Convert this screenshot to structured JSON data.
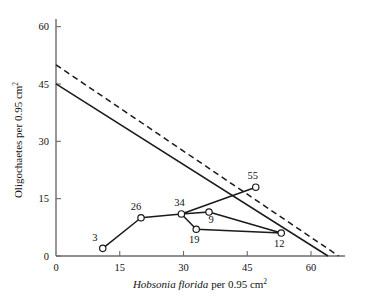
{
  "chart_data": {
    "type": "scatter",
    "title": "",
    "xlabel": "Hobsonia florida per 0.95 cm2",
    "xlabel_italic_part": "Hobsonia florida",
    "xlabel_plain_part": " per 0.95 cm",
    "xlabel_superscript": "2",
    "ylabel": "Oligochaetes per 0.95 cm2",
    "ylabel_plain_part": "Oligochaetes per 0.95 cm",
    "ylabel_superscript": "2",
    "xlim": [
      0,
      68
    ],
    "ylim": [
      0,
      62
    ],
    "xticks": [
      "0",
      "15",
      "30",
      "45",
      "60"
    ],
    "xtick_values": [
      0,
      15,
      30,
      45,
      60
    ],
    "yticks": [
      "0",
      "15",
      "30",
      "45",
      "60"
    ],
    "ytick_values": [
      0,
      15,
      30,
      45,
      60
    ],
    "grid": false,
    "legend": "none",
    "points": [
      {
        "label": "3",
        "x": 11.0,
        "y": 2.0,
        "label_dx": -8,
        "label_dy": -7
      },
      {
        "label": "26",
        "x": 20.0,
        "y": 10.0,
        "label_dx": -5,
        "label_dy": -8
      },
      {
        "label": "34",
        "x": 29.5,
        "y": 11.0,
        "label_dx": -2,
        "label_dy": -8
      },
      {
        "label": "9",
        "x": 36.0,
        "y": 11.5,
        "label_dx": 2,
        "label_dy": 11
      },
      {
        "label": "19",
        "x": 33.0,
        "y": 7.0,
        "label_dx": -2,
        "label_dy": 14
      },
      {
        "label": "12",
        "x": 53.0,
        "y": 6.0,
        "label_dx": -2,
        "label_dy": 14
      },
      {
        "label": "55",
        "x": 47.0,
        "y": 18.0,
        "label_dx": -3,
        "label_dy": -8
      }
    ],
    "trajectory_order": [
      "3",
      "26",
      "34",
      "9",
      "12",
      "19",
      "34",
      "55"
    ],
    "series": [
      {
        "name": "solid-regression-line",
        "style": "solid",
        "x": [
          0,
          64.0
        ],
        "values": [
          45.0,
          0.0
        ]
      },
      {
        "name": "dashed-regression-line",
        "style": "dashed",
        "x": [
          0,
          66.5
        ],
        "values": [
          50.0,
          0.0
        ]
      },
      {
        "name": "data-trajectory",
        "style": "solid-connected",
        "x": [
          11.0,
          20.0,
          29.5,
          36.0,
          53.0,
          33.0,
          29.5,
          47.0
        ],
        "values": [
          2.0,
          10.0,
          11.0,
          11.5,
          6.0,
          7.0,
          11.0,
          18.0
        ]
      }
    ],
    "colors": {
      "line": "#1a1a1a",
      "axis": "#6b6b6b",
      "marker_fill": "#ffffff",
      "background": "#ffffff"
    }
  }
}
